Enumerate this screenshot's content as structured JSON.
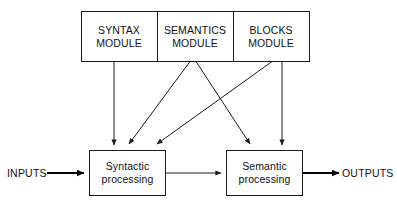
{
  "diagram": {
    "type": "block-diagram",
    "title": "",
    "modules": [
      {
        "id": "syntax",
        "line1": "SYNTAX",
        "line2": "MODULE"
      },
      {
        "id": "semantics",
        "line1": "SEMANTICS",
        "line2": "MODULE"
      },
      {
        "id": "blocks",
        "line1": "BLOCKS",
        "line2": "MODULE"
      }
    ],
    "processors": [
      {
        "id": "syntactic",
        "line1": "Syntactic",
        "line2": "processing"
      },
      {
        "id": "semantic",
        "line1": "Semantic",
        "line2": "processing"
      }
    ],
    "io": {
      "input_label": "INPUTS",
      "output_label": "OUTPUTS"
    },
    "connections": [
      {
        "from": "syntax",
        "to": "syntactic"
      },
      {
        "from": "semantics",
        "to": "syntactic"
      },
      {
        "from": "semantics",
        "to": "semantic"
      },
      {
        "from": "blocks",
        "to": "syntactic"
      },
      {
        "from": "blocks",
        "to": "semantic"
      },
      {
        "from": "syntactic",
        "to": "semantic"
      },
      {
        "from": "inputs",
        "to": "syntactic"
      },
      {
        "from": "semantic",
        "to": "outputs"
      }
    ],
    "colors": {
      "stroke": "#1a1a1a",
      "fill": "#ffffff",
      "text": "#111111",
      "background": "#ffffff"
    }
  }
}
